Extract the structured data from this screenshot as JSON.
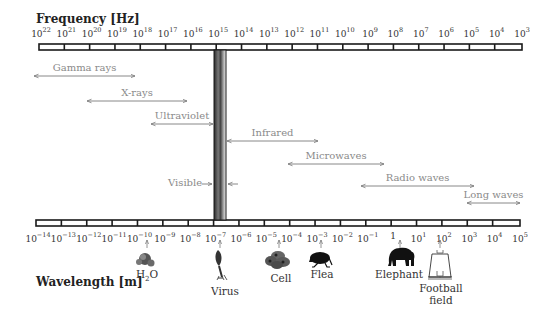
{
  "frequency_axis": {
    "title": "Frequency [Hz]",
    "base": "10",
    "exponents": [
      "22",
      "21",
      "20",
      "19",
      "18",
      "17",
      "16",
      "15",
      "14",
      "13",
      "12",
      "11",
      "10",
      "9",
      "8",
      "7",
      "6",
      "5",
      "4",
      "3"
    ]
  },
  "wavelength_axis": {
    "title": "Wavelength [m]",
    "labels": [
      {
        "base": "10",
        "exp": "−14"
      },
      {
        "base": "10",
        "exp": "−13"
      },
      {
        "base": "10",
        "exp": "−12"
      },
      {
        "base": "10",
        "exp": "−11"
      },
      {
        "base": "10",
        "exp": "−10"
      },
      {
        "base": "10",
        "exp": "−9"
      },
      {
        "base": "10",
        "exp": "−8"
      },
      {
        "base": "10",
        "exp": "−7"
      },
      {
        "base": "10",
        "exp": "−6"
      },
      {
        "base": "10",
        "exp": "−5"
      },
      {
        "base": "10",
        "exp": "−4"
      },
      {
        "base": "10",
        "exp": "−3"
      },
      {
        "base": "10",
        "exp": "−2"
      },
      {
        "base": "10",
        "exp": "−1"
      },
      {
        "base": "1",
        "exp": ""
      },
      {
        "base": "10",
        "exp": "1"
      },
      {
        "base": "10",
        "exp": "2"
      },
      {
        "base": "10",
        "exp": "3"
      },
      {
        "base": "10",
        "exp": "4"
      },
      {
        "base": "10",
        "exp": "5"
      }
    ]
  },
  "bands": [
    {
      "name": "Gamma rays",
      "x1": 34,
      "x2": 135,
      "y": 76
    },
    {
      "name": "X-rays",
      "x1": 87,
      "x2": 187,
      "y": 101
    },
    {
      "name": "Ultraviolet",
      "x1": 151,
      "x2": 213,
      "y": 124
    },
    {
      "name": "Infrared",
      "x1": 227,
      "x2": 318,
      "y": 141
    },
    {
      "name": "Microwaves",
      "x1": 288,
      "x2": 384,
      "y": 164
    },
    {
      "name": "Radio waves",
      "x1": 361,
      "x2": 474,
      "y": 186
    },
    {
      "name": "Long waves",
      "x1": 467,
      "x2": 520,
      "y": 203
    }
  ],
  "visible": {
    "label": "Visible",
    "y": 184
  },
  "objects": [
    {
      "name": "H2O",
      "label_main": "H",
      "label_sub": "2",
      "label_tail": "O",
      "x": 147
    },
    {
      "name": "Virus",
      "label": "Virus",
      "x": 220
    },
    {
      "name": "Cell",
      "label": "Cell",
      "x": 279
    },
    {
      "name": "Flea",
      "label": "Flea",
      "x": 321
    },
    {
      "name": "Elephant",
      "label": "Elephant",
      "x": 400
    },
    {
      "name": "Football field",
      "label_line1": "Football",
      "label_line2": "field",
      "x": 440
    }
  ],
  "colors": {
    "bar_outline": "#1a1a1a",
    "band_text": "#8a8a8a",
    "arrow": "#7a7a7a",
    "visible_bar": "#555555"
  }
}
